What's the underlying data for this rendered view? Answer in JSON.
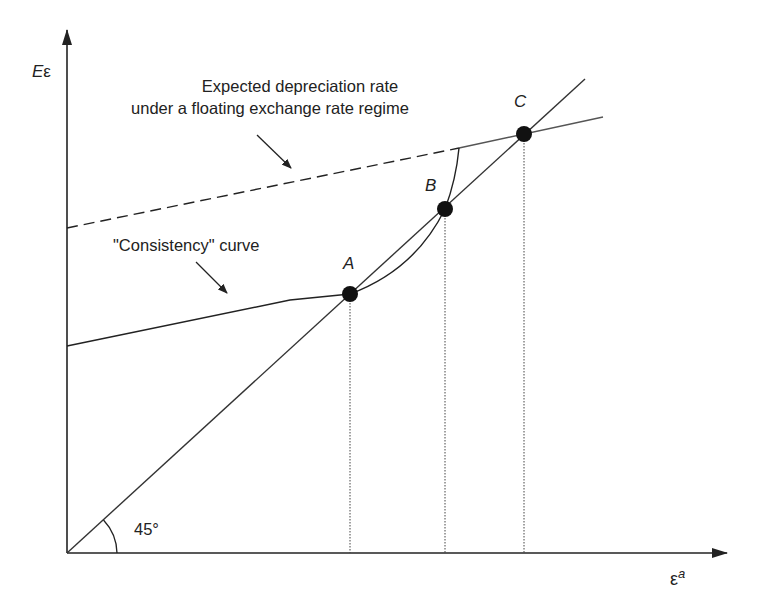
{
  "diagram": {
    "type": "economic-diagram",
    "axes": {
      "y_label_main": "E",
      "y_label_greek": "ε",
      "x_label_greek": "ε",
      "x_label_sup": "a"
    },
    "annotations": {
      "floating_line_label_line1": "Expected depreciation rate",
      "floating_line_label_line2": "under a floating exchange rate regime",
      "consistency_label": "\"Consistency\" curve",
      "angle_label": "45°"
    },
    "points": [
      {
        "name": "A",
        "x": 350,
        "y": 294
      },
      {
        "name": "B",
        "x": 445,
        "y": 209
      },
      {
        "name": "C",
        "x": 524,
        "y": 134
      }
    ],
    "lines": {
      "forty_five_degree": {
        "from": [
          67,
          553
        ],
        "to": [
          585,
          79
        ]
      },
      "floating_dashed": {
        "from": [
          67,
          228
        ],
        "to": [
          459,
          148
        ]
      },
      "floating_solid": {
        "from": [
          459,
          148
        ],
        "to": [
          603,
          117
        ]
      },
      "consistency_straight": {
        "from": [
          67,
          346
        ],
        "to": [
          290,
          300
        ]
      }
    },
    "colors": {
      "ink": "#222222",
      "line_gray": "#555555",
      "background": "#ffffff"
    }
  }
}
